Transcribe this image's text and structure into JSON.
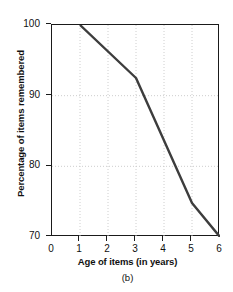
{
  "chart_data": {
    "type": "line",
    "title": "",
    "caption": "(b)",
    "xlabel": "Age of items (in years)",
    "ylabel": "Percentage of items remembered",
    "xlim": [
      0,
      6
    ],
    "ylim": [
      70,
      100
    ],
    "xticks": [
      0,
      1,
      2,
      3,
      4,
      5,
      6
    ],
    "yticks": [
      70,
      80,
      90,
      100
    ],
    "xtick_labels": [
      "0",
      "1",
      "2",
      "3",
      "4",
      "5",
      "6"
    ],
    "ytick_labels": [
      "70",
      "80",
      "90",
      "100"
    ],
    "grid": true,
    "grid_style": "dotted",
    "grid_color": "#c8c8c8",
    "legend": null,
    "series": [
      {
        "name": "Percentage of items remembered",
        "color": "#3d3d3d",
        "line_width": 2.4,
        "x": [
          1,
          3,
          5,
          6
        ],
        "values": [
          100,
          92.5,
          74.8,
          70
        ],
        "points": [
          {
            "x": 1,
            "y": 100
          },
          {
            "x": 3,
            "y": 92.5
          },
          {
            "x": 5,
            "y": 74.8
          },
          {
            "x": 6,
            "y": 70
          }
        ]
      }
    ]
  },
  "axes": {
    "frame_color": "#1a1a1a"
  }
}
